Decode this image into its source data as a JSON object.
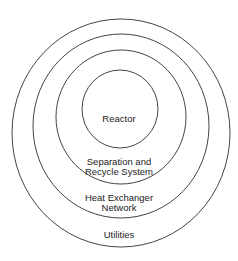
{
  "diagram": {
    "type": "onion-diagram",
    "layers": [
      {
        "label": "Reactor",
        "cx": 120,
        "cy": 109,
        "rx": 38,
        "ry": 39
      },
      {
        "label": "Separation and Recycle System",
        "cx": 121,
        "cy": 117,
        "rx": 65,
        "ry": 67
      },
      {
        "label": "Heat Exchanger Network",
        "cx": 121,
        "cy": 126,
        "rx": 88,
        "ry": 92
      },
      {
        "label": "Utilities",
        "cx": 121,
        "cy": 133,
        "rx": 109,
        "ry": 114
      }
    ],
    "labels": {
      "reactor": "Reactor",
      "separation_line1": "Separation and",
      "separation_line2": "Recycle System",
      "hen_line1": "Heat Exchanger",
      "hen_line2": "Network",
      "utilities": "Utilities"
    },
    "stroke_color": "#444444"
  }
}
